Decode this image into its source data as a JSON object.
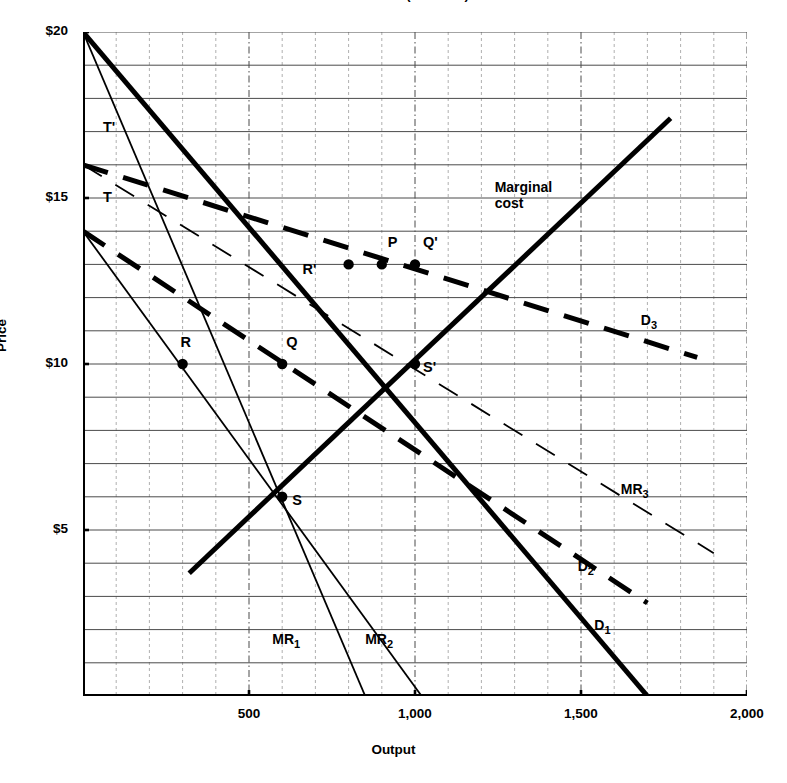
{
  "title": "Exhibit 32-1A (Solution)",
  "axes": {
    "y_title": "Price",
    "x_title": "Output",
    "y_ticks": [
      "$20",
      "$15",
      "$10",
      "$5"
    ],
    "y_tick_values": [
      20,
      15,
      10,
      5
    ],
    "x_ticks": [
      "500",
      "1,000",
      "1,500",
      "2,000"
    ],
    "x_tick_values": [
      500,
      1000,
      1500,
      2000
    ]
  },
  "chart_data": {
    "type": "line",
    "title": "Exhibit 32-1A (Solution)",
    "xlabel": "Output",
    "ylabel": "Price",
    "xlim": [
      0,
      2000
    ],
    "ylim": [
      0,
      20
    ],
    "grid": true,
    "grid_x_step": 100,
    "grid_y_step": 1,
    "legend": "inline-labels",
    "series": [
      {
        "name": "D1",
        "label": "D_1",
        "style": "thick-solid",
        "points": [
          [
            0,
            20
          ],
          [
            1700,
            0
          ]
        ],
        "label_xy": [
          1540,
          2.1
        ]
      },
      {
        "name": "D2",
        "label": "D_2",
        "style": "thick-dashed",
        "points": [
          [
            0,
            14
          ],
          [
            1700,
            2.8
          ]
        ],
        "label_xy": [
          1490,
          3.9
        ]
      },
      {
        "name": "D3",
        "label": "D_3",
        "style": "thick-dashed",
        "points": [
          [
            0,
            16
          ],
          [
            1850,
            10.2
          ]
        ],
        "label_xy": [
          1680,
          11.3
        ]
      },
      {
        "name": "MR1",
        "label": "MR_1",
        "style": "thin-solid",
        "points": [
          [
            0,
            20
          ],
          [
            850,
            0
          ]
        ],
        "label_xy": [
          570,
          1.7
        ]
      },
      {
        "name": "MR2",
        "label": "MR_2",
        "style": "thin-solid",
        "points": [
          [
            0,
            14
          ],
          [
            1020,
            0
          ]
        ],
        "label_xy": [
          850,
          1.7
        ]
      },
      {
        "name": "MR3",
        "label": "MR_3",
        "style": "thin-dashed",
        "points": [
          [
            0,
            16
          ],
          [
            1900,
            4.3
          ]
        ],
        "label_xy": [
          1620,
          6.2
        ]
      },
      {
        "name": "MarginalCost",
        "label": "Marginal cost",
        "style": "thick-solid",
        "points": [
          [
            320,
            3.7
          ],
          [
            1770,
            17.4
          ]
        ],
        "label_xy": [
          1240,
          15.3
        ]
      }
    ],
    "points": [
      {
        "name": "R",
        "x": 300,
        "y": 10,
        "label": "R",
        "label_dx": -2,
        "label_dy": 22
      },
      {
        "name": "R'",
        "x": 800,
        "y": 13,
        "label": "R'",
        "label_dx": -46,
        "label_dy": -5
      },
      {
        "name": "P",
        "x": 900,
        "y": 13,
        "label": "P",
        "label_dx": 6,
        "label_dy": 22
      },
      {
        "name": "Q",
        "x": 600,
        "y": 10,
        "label": "Q",
        "label_dx": 4,
        "label_dy": 22
      },
      {
        "name": "Q'",
        "x": 1000,
        "y": 13,
        "label": "Q'",
        "label_dx": 8,
        "label_dy": 22
      },
      {
        "name": "S",
        "x": 600,
        "y": 6,
        "label": "S",
        "label_dx": 10,
        "label_dy": -3
      },
      {
        "name": "S'",
        "x": 1000,
        "y": 10,
        "label": "S'",
        "label_dx": 8,
        "label_dy": -3
      }
    ],
    "intercept_labels": [
      {
        "name": "T'",
        "text": "T'",
        "x": 60,
        "y": 17.1
      },
      {
        "name": "T",
        "text": "T",
        "x": 60,
        "y": 15.0
      }
    ]
  },
  "colors": {
    "ink": "#000000",
    "grid_major": "#4a4a4a",
    "grid_minor": "#9a9a9a",
    "background": "#ffffff"
  }
}
